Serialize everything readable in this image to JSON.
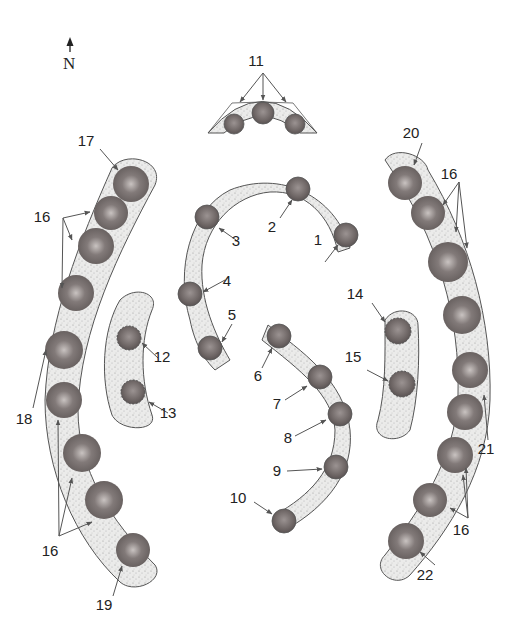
{
  "colors": {
    "band_fill": "#e6e6e4",
    "band_stroke": "#555555",
    "disc_fill": "#7a7272",
    "disc_dark": "#5e5656",
    "disc_light": "#bdb7b5",
    "arrow": "#555555",
    "text": "#222222"
  },
  "north_label": "N",
  "labels": [
    {
      "id": "1",
      "text": "1",
      "x": 318,
      "y": 245
    },
    {
      "id": "2",
      "text": "2",
      "x": 272,
      "y": 232
    },
    {
      "id": "3",
      "text": "3",
      "x": 236,
      "y": 246
    },
    {
      "id": "4",
      "text": "4",
      "x": 227,
      "y": 286
    },
    {
      "id": "5",
      "text": "5",
      "x": 232,
      "y": 320
    },
    {
      "id": "6",
      "text": "6",
      "x": 258,
      "y": 381
    },
    {
      "id": "7",
      "text": "7",
      "x": 277,
      "y": 409
    },
    {
      "id": "8",
      "text": "8",
      "x": 288,
      "y": 443
    },
    {
      "id": "9",
      "text": "9",
      "x": 277,
      "y": 476
    },
    {
      "id": "10",
      "text": "10",
      "x": 238,
      "y": 503
    },
    {
      "id": "11",
      "text": "11",
      "x": 256,
      "y": 66
    },
    {
      "id": "12",
      "text": "12",
      "x": 162,
      "y": 362
    },
    {
      "id": "13",
      "text": "13",
      "x": 168,
      "y": 418
    },
    {
      "id": "14",
      "text": "14",
      "x": 355,
      "y": 299
    },
    {
      "id": "15",
      "text": "15",
      "x": 353,
      "y": 362
    },
    {
      "id": "16a",
      "text": "16",
      "x": 42,
      "y": 222
    },
    {
      "id": "16b",
      "text": "16",
      "x": 449,
      "y": 179
    },
    {
      "id": "16c",
      "text": "16",
      "x": 50,
      "y": 556
    },
    {
      "id": "16d",
      "text": "16",
      "x": 461,
      "y": 535
    },
    {
      "id": "17",
      "text": "17",
      "x": 86,
      "y": 146
    },
    {
      "id": "18",
      "text": "18",
      "x": 24,
      "y": 424
    },
    {
      "id": "19",
      "text": "19",
      "x": 104,
      "y": 610
    },
    {
      "id": "20",
      "text": "20",
      "x": 411,
      "y": 138
    },
    {
      "id": "21",
      "text": "21",
      "x": 486,
      "y": 454
    },
    {
      "id": "22",
      "text": "22",
      "x": 425,
      "y": 580
    }
  ]
}
